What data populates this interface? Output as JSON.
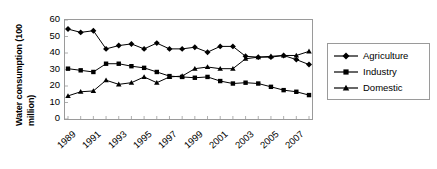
{
  "chart_data": {
    "type": "line",
    "title": "",
    "xlabel": "",
    "ylabel": "Water consumption (100 million)",
    "ylabel_lines": [
      "Water consumption (100",
      "million)"
    ],
    "ylim": [
      0,
      60
    ],
    "yticks": [
      0,
      10,
      20,
      30,
      40,
      50,
      60
    ],
    "ytick_labels": [
      "0",
      "10",
      "20",
      "30",
      "40",
      "50",
      "60"
    ],
    "grid": false,
    "legend_position": "right",
    "x": [
      1989,
      1990,
      1991,
      1992,
      1993,
      1994,
      1995,
      1996,
      1997,
      1998,
      1999,
      2000,
      2001,
      2002,
      2003,
      2004,
      2005,
      2006,
      2007,
      2008
    ],
    "xtick_labels": [
      "1989",
      "1991",
      "1993",
      "1995",
      "1997",
      "1999",
      "2001",
      "2003",
      "2005",
      "2007"
    ],
    "xtick_values": [
      1989,
      1991,
      1993,
      1995,
      1997,
      1999,
      2001,
      2003,
      2005,
      2007
    ],
    "series": [
      {
        "name": "Agriculture",
        "marker": "diamond",
        "color": "#000000",
        "values": [
          54.5,
          52.5,
          53.5,
          42.5,
          44.5,
          45.5,
          42.5,
          46.0,
          42.5,
          42.5,
          43.5,
          40.5,
          44.0,
          44.0,
          38.0,
          37.5,
          37.5,
          38.5,
          36.0,
          33.0
        ]
      },
      {
        "name": "Industry",
        "marker": "square",
        "color": "#000000",
        "values": [
          30.5,
          29.5,
          28.5,
          33.5,
          33.5,
          32.0,
          31.0,
          28.5,
          26.0,
          25.5,
          25.0,
          25.5,
          23.0,
          21.5,
          22.0,
          21.5,
          19.5,
          17.5,
          16.5,
          14.5
        ]
      },
      {
        "name": "Domestic",
        "marker": "triangle",
        "color": "#000000",
        "values": [
          14.0,
          16.5,
          17.0,
          23.5,
          21.0,
          22.0,
          25.5,
          22.0,
          25.5,
          26.0,
          30.5,
          31.5,
          30.5,
          30.5,
          36.5,
          37.5,
          38.0,
          38.5,
          38.5,
          41.0
        ]
      }
    ]
  },
  "legend": {
    "items": [
      {
        "label": "Agriculture",
        "marker": "diamond"
      },
      {
        "label": "Industry",
        "marker": "square"
      },
      {
        "label": "Domestic",
        "marker": "triangle"
      }
    ]
  }
}
